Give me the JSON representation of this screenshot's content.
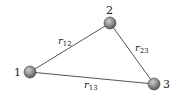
{
  "diagram": {
    "nodes": [
      {
        "id": "1",
        "label": "1",
        "x": 30,
        "y": 72
      },
      {
        "id": "2",
        "label": "2",
        "x": 110,
        "y": 23
      },
      {
        "id": "3",
        "label": "3",
        "x": 154,
        "y": 84
      }
    ],
    "edges": [
      {
        "from": "1",
        "to": "2",
        "label": "r",
        "sub": "12"
      },
      {
        "from": "2",
        "to": "3",
        "label": "r",
        "sub": "23"
      },
      {
        "from": "1",
        "to": "3",
        "label": "r",
        "sub": "13"
      }
    ],
    "colors": {
      "node_fill": "#8a8a8a",
      "edge": "#555555"
    }
  }
}
